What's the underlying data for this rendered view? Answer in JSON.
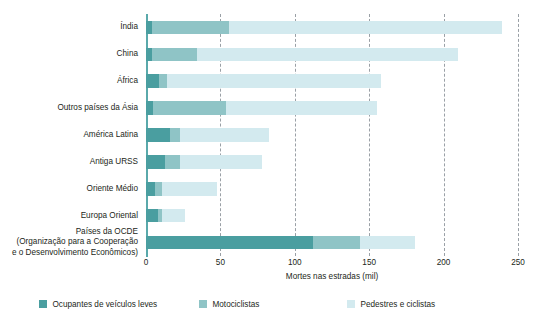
{
  "chart_data": {
    "type": "bar",
    "orientation": "horizontal",
    "stacked": true,
    "title": "",
    "xlabel": "Mortes nas estradas (mil)",
    "ylabel": "",
    "xlim": [
      0,
      250
    ],
    "xticks": [
      0,
      50,
      100,
      150,
      200,
      250
    ],
    "xtick_labels": [
      "0",
      "50",
      "100",
      "150",
      "200",
      "250"
    ],
    "grid": "vertical-dashed",
    "legend_position": "bottom",
    "categories": [
      "Índia",
      "China",
      "África",
      "Outros países da Ásia",
      "América Latina",
      "Antiga URSS",
      "Oriente Médio",
      "Europa Oriental",
      "Países da OCDE\n(Organização para a Cooperação\ne o Desenvolvimento Econômicos)"
    ],
    "series": [
      {
        "name": "Ocupantes de veículos leves",
        "color": "#4a9ea0",
        "values": [
          4,
          4,
          9,
          5,
          16,
          13,
          6,
          8,
          112
        ]
      },
      {
        "name": "Motociclistas",
        "color": "#8fc4c6",
        "values": [
          52,
          30,
          5,
          49,
          7,
          10,
          5,
          3,
          32
        ]
      },
      {
        "name": "Pedestres e ciclistas",
        "color": "#d3eaef",
        "values": [
          183,
          176,
          144,
          101,
          60,
          55,
          37,
          15,
          37
        ]
      }
    ],
    "totals": [
      239,
      210,
      158,
      155,
      83,
      78,
      48,
      26,
      181
    ]
  },
  "axis": {
    "xlabel": "Mortes nas estradas (mil)"
  },
  "legend": {
    "items": [
      {
        "label": "Ocupantes de veículos leves",
        "color": "#4a9ea0",
        "swatch": "legend-swatch-dark"
      },
      {
        "label": "Motociclistas",
        "color": "#8fc4c6",
        "swatch": "legend-swatch-medium"
      },
      {
        "label": "Pedestres e ciclistas",
        "color": "#d3eaef",
        "swatch": "legend-swatch-light"
      }
    ]
  },
  "categories": {
    "labels": [
      {
        "line1": "Índia",
        "line2": "",
        "line3": ""
      },
      {
        "line1": "China",
        "line2": "",
        "line3": ""
      },
      {
        "line1": "África",
        "line2": "",
        "line3": ""
      },
      {
        "line1": "Outros países da Ásia",
        "line2": "",
        "line3": ""
      },
      {
        "line1": "América Latina",
        "line2": "",
        "line3": ""
      },
      {
        "line1": "Antiga URSS",
        "line2": "",
        "line3": ""
      },
      {
        "line1": "Oriente Médio",
        "line2": "",
        "line3": ""
      },
      {
        "line1": "Europa Oriental",
        "line2": "",
        "line3": ""
      },
      {
        "line1": "Países da OCDE",
        "line2": "(Organização para a Cooperação",
        "line3": "e o Desenvolvimento Econômicos)"
      }
    ]
  },
  "xticks": {
    "labels": [
      "0",
      "50",
      "100",
      "150",
      "200",
      "250"
    ]
  }
}
